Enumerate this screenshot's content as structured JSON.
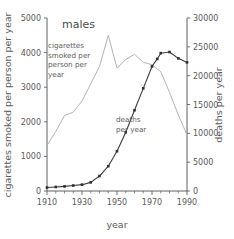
{
  "chart_data": {
    "type": "line",
    "title": "males",
    "xlabel": "year",
    "ylabel": "cigarettes smoked per person per year",
    "y2label": "deaths per year",
    "xlim": [
      1910,
      1990
    ],
    "ylim": [
      0,
      5000
    ],
    "y2lim": [
      0,
      30000
    ],
    "xticks": [
      1910,
      1930,
      1950,
      1970,
      1990
    ],
    "xtick_labels": [
      "1910",
      "1930",
      "1950",
      "1970",
      "1990"
    ],
    "xminor_step": 5,
    "yticks": [
      0,
      1000,
      2000,
      3000,
      4000,
      5000
    ],
    "ytick_labels": [
      "0",
      "1000",
      "2000",
      "3000",
      "4000",
      "5000"
    ],
    "y2ticks": [
      0,
      5000,
      10000,
      15000,
      20000,
      25000,
      30000
    ],
    "y2tick_labels": [
      "0",
      "5000",
      "10000",
      "15000",
      "20000",
      "25000",
      "30000"
    ],
    "grid": false,
    "legend_position": "inline-annotations",
    "series": [
      {
        "name": "cigarettes smoked per person per year",
        "axis": "left",
        "color": "#b4b4b4",
        "markers": false,
        "x": [
          1910,
          1915,
          1920,
          1925,
          1930,
          1935,
          1940,
          1945,
          1950,
          1955,
          1960,
          1965,
          1970,
          1975,
          1980,
          1985,
          1990
        ],
        "values": [
          1320,
          1720,
          2180,
          2280,
          2600,
          3100,
          3600,
          4500,
          3550,
          3800,
          3950,
          3720,
          3650,
          3450,
          2850,
          2200,
          1620
        ]
      },
      {
        "name": "deaths per year",
        "axis": "right",
        "color": "#2e2e2e",
        "markers": true,
        "x": [
          1910,
          1915,
          1920,
          1925,
          1930,
          1935,
          1940,
          1945,
          1950,
          1955,
          1960,
          1965,
          1970,
          1973,
          1975,
          1980,
          1985,
          1990
        ],
        "values": [
          600,
          700,
          800,
          950,
          1100,
          1500,
          2600,
          4300,
          6900,
          10200,
          14000,
          17800,
          21600,
          22900,
          23900,
          24100,
          23000,
          22300
        ]
      }
    ],
    "annotations": [
      {
        "name": "cigarettes-series-label",
        "lines": [
          "cigarettes",
          "smoked per",
          "person per",
          "year"
        ],
        "x_px": 48,
        "y_px": 48
      },
      {
        "name": "deaths-series-label",
        "lines": [
          "deaths",
          "per year"
        ],
        "x_px": 116,
        "y_px": 122
      }
    ]
  }
}
